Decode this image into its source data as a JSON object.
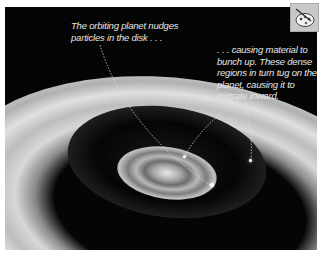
{
  "image": {
    "description": "Illustration of a protoplanetary disk with an orbiting planet and ring structures",
    "captions": {
      "caption_1": "The orbiting planet nudges particles in the disk . . .",
      "caption_2": ". . . causing material to bunch up. These dense regions in turn tug on the planet, causing it to migrate inward."
    }
  },
  "toolbar": {
    "icon": "palette-icon"
  }
}
